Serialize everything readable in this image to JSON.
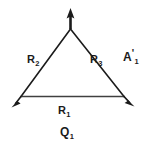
{
  "figure": {
    "background_color": "#ffffff",
    "stroke_color": "#1b1b1b",
    "labels": {
      "r1": {
        "base": "R",
        "sub": "1"
      },
      "r2": {
        "base": "R",
        "sub": "2"
      },
      "r3": {
        "base": "R",
        "sub": "3"
      },
      "a1": {
        "base": "A",
        "prime": "'",
        "sub": "1"
      },
      "q1": {
        "base": "Q",
        "sub": "1"
      }
    },
    "geometry": {
      "apex": [
        70.5,
        29
      ],
      "bottom_left": [
        21,
        96.5
      ],
      "bottom_right": [
        124,
        96.5
      ],
      "apex_arrow_tip": [
        70.5,
        9
      ],
      "left_arrow_tip": [
        12,
        107
      ],
      "right_arrow_tip": [
        134,
        106
      ]
    }
  }
}
